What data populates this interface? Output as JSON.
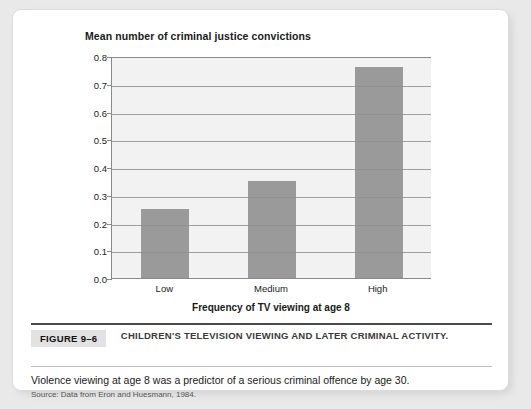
{
  "chart_data": {
    "type": "bar",
    "title": "Mean number of criminal justice convictions",
    "xlabel": "Frequency of TV viewing at age 8",
    "ylabel": "",
    "categories": [
      "Low",
      "Medium",
      "High"
    ],
    "values": [
      0.25,
      0.35,
      0.76
    ],
    "ylim": [
      0.0,
      0.8
    ],
    "ytick_labels": [
      "0.0",
      "0.1",
      "0.2",
      "0.3",
      "0.4",
      "0.5",
      "0.6",
      "0.7",
      "0.8"
    ],
    "ytick_values": [
      0.0,
      0.1,
      0.2,
      0.3,
      0.4,
      0.5,
      0.6,
      0.7,
      0.8
    ],
    "grid": true,
    "legend": "none",
    "bar_color": "#9a9a9a",
    "plot_background": "#f2f2f2"
  },
  "caption": {
    "figure_label": "FIGURE 9–6",
    "figure_title": "CHILDREN'S TELEVISION VIEWING AND LATER CRIMINAL ACTIVITY.",
    "body": "Violence viewing at age 8 was a predictor of a serious criminal offence by age 30.",
    "source": "Source: Data from Eron and Huesmann, 1984."
  }
}
